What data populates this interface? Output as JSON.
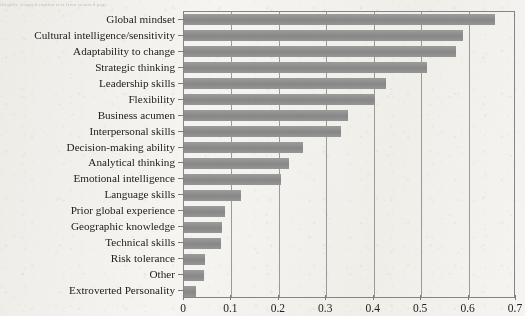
{
  "top_caption": "illegible cropped caption text from scanned page",
  "chart_data": {
    "type": "bar",
    "orientation": "horizontal",
    "title": "",
    "xlabel": "",
    "ylabel": "",
    "xlim": [
      0,
      0.7
    ],
    "xticks": [
      0,
      0.1,
      0.2,
      0.3,
      0.4,
      0.5,
      0.6,
      0.7
    ],
    "xtick_labels": [
      "0",
      "0.1",
      "0.2",
      "0.3",
      "0.4",
      "0.5",
      "0.6",
      "0.7"
    ],
    "grid": "vertical",
    "legend": "none",
    "bar_color": "#8e8e8e",
    "axis_color": "#868380",
    "categories": [
      "Global mindset",
      "Cultural intelligence/sensitivity",
      "Adaptability to change",
      "Strategic thinking",
      "Leadership skills",
      "Flexibility",
      "Business acumen",
      "Interpersonal skills",
      "Decision-making ability",
      "Analytical thinking",
      "Emotional intelligence",
      "Language skills",
      "Prior global experience",
      "Geographic knowledge",
      "Technical skills",
      "Risk tolerance",
      "Other",
      "Extroverted Personality"
    ],
    "values": [
      0.655,
      0.588,
      0.573,
      0.512,
      0.425,
      0.402,
      0.346,
      0.33,
      0.25,
      0.222,
      0.205,
      0.12,
      0.086,
      0.08,
      0.078,
      0.044,
      0.042,
      0.025
    ]
  }
}
